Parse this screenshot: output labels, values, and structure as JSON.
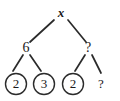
{
  "figure": {
    "type": "binary-tree-diagram",
    "background_color": "#ffffff",
    "stroke_color": "#2b2b2b",
    "text_color": "#1a1a1a"
  },
  "tree": {
    "root": {
      "id": "root",
      "label": "x",
      "style": "italic-bold",
      "circled": false,
      "x": 61,
      "y": 13
    },
    "internal_nodes": [
      {
        "id": "left-internal",
        "label": "6",
        "circled": false,
        "x": 26,
        "y": 48
      },
      {
        "id": "right-internal",
        "label": "?",
        "circled": false,
        "x": 88,
        "y": 48
      }
    ],
    "leaves": [
      {
        "id": "leaf-1",
        "label": "2",
        "circled": true,
        "cx": 16,
        "cy": 84,
        "r": 11
      },
      {
        "id": "leaf-2",
        "label": "3",
        "circled": true,
        "cx": 44,
        "cy": 84,
        "r": 11
      },
      {
        "id": "leaf-3",
        "label": "2",
        "circled": true,
        "cx": 73,
        "cy": 84,
        "r": 11
      },
      {
        "id": "leaf-4",
        "label": "?",
        "circled": false,
        "cx": 101,
        "cy": 84,
        "r": 0
      }
    ],
    "edges": [
      {
        "id": "edge-root-left",
        "from": "root",
        "to": "left-internal",
        "x1": 54,
        "y1": 20,
        "x2": 30,
        "y2": 42
      },
      {
        "id": "edge-root-right",
        "from": "root",
        "to": "right-internal",
        "x1": 68,
        "y1": 20,
        "x2": 86,
        "y2": 42
      },
      {
        "id": "edge-left-a",
        "from": "left-internal",
        "to": "leaf-1",
        "x1": 23,
        "y1": 55,
        "x2": 13,
        "y2": 71
      },
      {
        "id": "edge-left-b",
        "from": "left-internal",
        "to": "leaf-2",
        "x1": 30,
        "y1": 55,
        "x2": 41,
        "y2": 71
      },
      {
        "id": "edge-right-a",
        "from": "right-internal",
        "to": "leaf-3",
        "x1": 85,
        "y1": 55,
        "x2": 75,
        "y2": 71
      },
      {
        "id": "edge-right-b",
        "from": "right-internal",
        "to": "leaf-4",
        "x1": 92,
        "y1": 55,
        "x2": 101,
        "y2": 73
      }
    ]
  }
}
